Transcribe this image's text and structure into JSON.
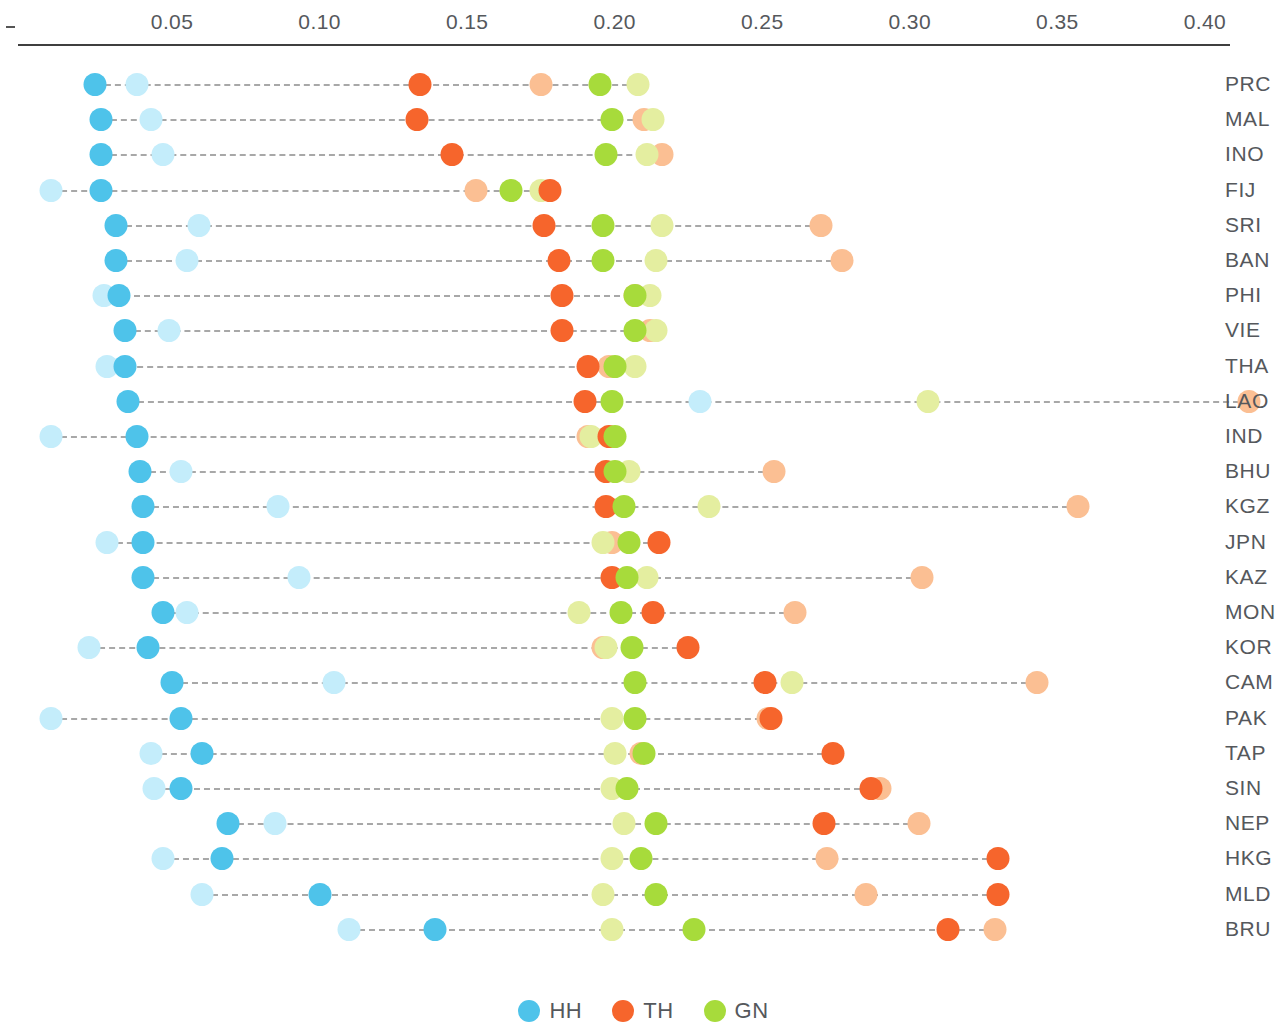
{
  "chart_data": {
    "type": "scatter",
    "title": "",
    "xlabel": "",
    "ylabel": "",
    "xlim": [
      0.0,
      0.415
    ],
    "grid": false,
    "legend_position": "bottom-center",
    "x_ticks": [
      0.05,
      0.1,
      0.15,
      0.2,
      0.25,
      0.3,
      0.35,
      0.4
    ],
    "x_tick_labels": [
      "0.05",
      "0.10",
      "0.15",
      "0.20",
      "0.25",
      "0.30",
      "0.35",
      "0.40"
    ],
    "categories": [
      "PRC",
      "MAL",
      "INO",
      "FIJ",
      "SRI",
      "BAN",
      "PHI",
      "VIE",
      "THA",
      "LAO",
      "IND",
      "BHU",
      "KGZ",
      "JPN",
      "KAZ",
      "MON",
      "KOR",
      "CAM",
      "PAK",
      "TAP",
      "SIN",
      "NEP",
      "HKG",
      "MLD",
      "BRU"
    ],
    "series": [
      {
        "name": "HH",
        "key": "hh",
        "color": "#4ec3ea",
        "values": [
          0.024,
          0.026,
          0.026,
          0.026,
          0.031,
          0.031,
          0.032,
          0.034,
          0.034,
          0.035,
          0.038,
          0.039,
          0.04,
          0.04,
          0.04,
          0.047,
          0.042,
          0.05,
          0.053,
          0.06,
          0.053,
          0.069,
          0.067,
          0.1,
          0.139
        ]
      },
      {
        "name": "HH light",
        "key": "hh_light",
        "color": "#c4edfb",
        "values": [
          0.038,
          0.043,
          0.047,
          0.009,
          0.059,
          0.055,
          0.027,
          0.049,
          0.028,
          0.229,
          0.009,
          0.053,
          0.086,
          0.028,
          0.093,
          0.055,
          0.022,
          0.105,
          0.009,
          0.043,
          0.044,
          0.085,
          0.047,
          0.06,
          0.11
        ]
      },
      {
        "name": "TH",
        "key": "th",
        "color": "#f6652c",
        "values": [
          0.134,
          0.133,
          0.145,
          0.178,
          0.176,
          0.181,
          0.182,
          0.182,
          0.191,
          0.19,
          0.198,
          0.197,
          0.197,
          0.215,
          0.199,
          0.213,
          0.225,
          0.251,
          0.253,
          0.274,
          0.287,
          0.271,
          0.33,
          0.33,
          0.313
        ]
      },
      {
        "name": "TH light",
        "key": "th_light",
        "color": "#fbbf93",
        "values": [
          0.175,
          0.21,
          0.216,
          0.153,
          0.27,
          0.277,
          0.207,
          0.212,
          0.198,
          0.415,
          0.191,
          0.254,
          0.357,
          0.199,
          0.304,
          0.261,
          0.196,
          0.343,
          0.252,
          0.209,
          0.29,
          0.303,
          0.272,
          0.285,
          0.329
        ]
      },
      {
        "name": "GN",
        "key": "gn",
        "color": "#a7db3b",
        "values": [
          0.195,
          0.199,
          0.197,
          0.165,
          0.196,
          0.196,
          0.207,
          0.207,
          0.2,
          0.199,
          0.2,
          0.2,
          0.203,
          0.205,
          0.204,
          0.202,
          0.206,
          0.207,
          0.207,
          0.21,
          0.204,
          0.214,
          0.209,
          0.214,
          0.227
        ]
      },
      {
        "name": "GN light",
        "key": "gn_light",
        "color": "#e4eea0",
        "values": [
          0.208,
          0.213,
          0.211,
          0.175,
          0.216,
          0.214,
          0.212,
          0.214,
          0.207,
          0.306,
          0.192,
          0.205,
          0.232,
          0.196,
          0.211,
          0.188,
          0.197,
          0.26,
          0.199,
          0.2,
          0.199,
          0.203,
          0.199,
          0.196,
          0.199
        ]
      }
    ],
    "legend": [
      {
        "label": "HH",
        "color": "#4ec3ea"
      },
      {
        "label": "TH",
        "color": "#f6652c"
      },
      {
        "label": "GN",
        "color": "#a7db3b"
      }
    ]
  },
  "axis": {
    "origin_dash": "-"
  }
}
